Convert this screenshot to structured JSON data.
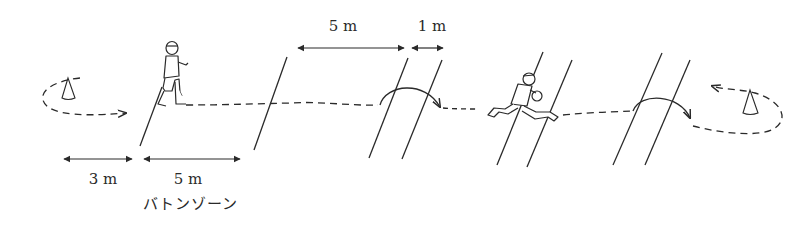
{
  "diagram": {
    "title": "",
    "labels": {
      "top_zone": "5 m",
      "top_gap": "1 m",
      "bottom_lead": "3 m",
      "bottom_zone": "5 m",
      "baton_zone": "バトンゾーン"
    },
    "elements": [
      {
        "id": "cone-left",
        "type": "cone",
        "icon": "cone-icon"
      },
      {
        "id": "runner-waiting",
        "type": "figure",
        "icon": "runner-standing-icon"
      },
      {
        "id": "runner-sprinting",
        "type": "figure",
        "icon": "runner-sprinting-icon"
      },
      {
        "id": "cone-right",
        "type": "cone",
        "icon": "cone-icon"
      }
    ],
    "colors": {
      "stroke": "#2a2a2a",
      "background": "#ffffff"
    }
  }
}
